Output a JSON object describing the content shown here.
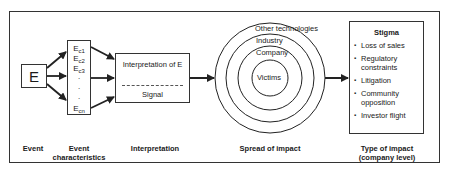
{
  "diagram": {
    "event_box": {
      "label": "E"
    },
    "characteristics": {
      "items": [
        "E",
        "E",
        "E",
        "·",
        "·",
        "·",
        "E"
      ],
      "subscripts": [
        "c1",
        "c2",
        "c3",
        "",
        "",
        "",
        "cn"
      ]
    },
    "interpretation_box": {
      "top_text": "Interpretation of E",
      "bottom_text": "Signal"
    },
    "rings": {
      "labels": [
        "Other technologies",
        "Industry",
        "Company",
        "Victims"
      ]
    },
    "stigma_box": {
      "title": "Stigma",
      "items": [
        "Loss of sales",
        "Regulatory constraints",
        "Litigation",
        "Community opposition",
        "Investor flight"
      ]
    },
    "captions": {
      "event": "Event",
      "event_characteristics": "Event characteristics",
      "interpretation": "Interpretation",
      "spread": "Spread of impact",
      "type_of_impact": "Type of impact (company level)"
    },
    "colors": {
      "line": "#333333",
      "text": "#1a1a1a",
      "background": "#ffffff"
    }
  }
}
